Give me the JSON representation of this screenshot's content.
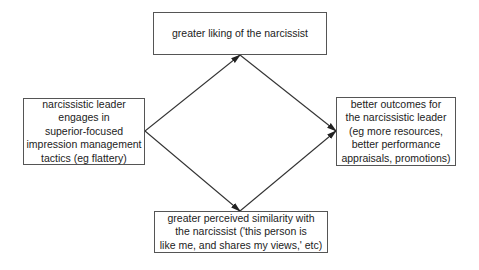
{
  "diagram": {
    "nodes": {
      "left": {
        "label": "narcissistic leader\nengages in\nsuperior-focused\nimpression management\ntactics (eg flattery)"
      },
      "top": {
        "label": "greater liking of the narcissist"
      },
      "bottom": {
        "label": "greater perceived similarity with\nthe narcissist ('this person is\nlike me, and shares my views,' etc)"
      },
      "right": {
        "label": "better outcomes for\nthe narcissistic leader\n(eg more resources,\nbetter performance\nappraisals, promotions)"
      }
    },
    "edges": [
      {
        "from": "left",
        "to": "top"
      },
      {
        "from": "left",
        "to": "bottom"
      },
      {
        "from": "top",
        "to": "right"
      },
      {
        "from": "bottom",
        "to": "right"
      }
    ],
    "colors": {
      "line": "#333333",
      "border": "#555555",
      "text": "#222222"
    }
  }
}
